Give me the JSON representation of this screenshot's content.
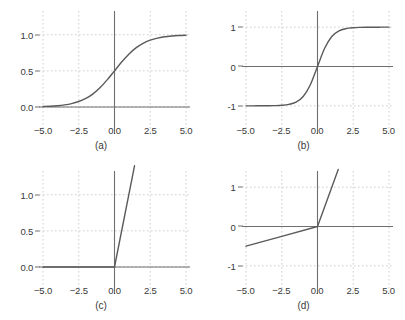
{
  "figure": {
    "columns": 2,
    "rows": 2,
    "background": "#ffffff",
    "curve_color": "#5a5a5a",
    "axis_color": "#6f6f6f",
    "grid_color": "#cfcfcf",
    "text_color": "#3a3a3a"
  },
  "chart_data": [
    {
      "type": "line",
      "panel": "a",
      "caption": "(a)",
      "title": "",
      "function": "sigmoid",
      "xlabel": "",
      "ylabel": "",
      "xlim": [
        -5.0,
        5.0
      ],
      "ylim": [
        -0.18,
        1.3
      ],
      "grid": true,
      "legend": "none",
      "xticks": [
        -5.0,
        -2.5,
        0.0,
        2.5,
        5.0
      ],
      "xticklabels": [
        "-5.0",
        "-2.5",
        "0.0",
        "2.5",
        "5.0"
      ],
      "yticks": [
        0.0,
        0.5,
        1.0
      ],
      "yticklabels": [
        "0.0",
        "0.5",
        "1.0"
      ],
      "x": [
        -5.0,
        -4.5,
        -4.0,
        -3.5,
        -3.0,
        -2.5,
        -2.0,
        -1.5,
        -1.0,
        -0.5,
        0.0,
        0.5,
        1.0,
        1.5,
        2.0,
        2.5,
        3.0,
        3.5,
        4.0,
        4.5,
        5.0
      ],
      "values": [
        0.007,
        0.011,
        0.018,
        0.029,
        0.047,
        0.076,
        0.119,
        0.182,
        0.269,
        0.378,
        0.5,
        0.622,
        0.731,
        0.818,
        0.881,
        0.924,
        0.953,
        0.971,
        0.982,
        0.989,
        0.993
      ]
    },
    {
      "type": "line",
      "panel": "b",
      "caption": "(b)",
      "title": "",
      "function": "tanh",
      "xlabel": "",
      "ylabel": "",
      "xlim": [
        -5.0,
        5.0
      ],
      "ylim": [
        -1.36,
        1.36
      ],
      "grid": true,
      "legend": "none",
      "xticks": [
        -5.0,
        -2.5,
        0.0,
        2.5,
        5.0
      ],
      "xticklabels": [
        "-5.0",
        "-2.5",
        "0.0",
        "2.5",
        "5.0"
      ],
      "yticks": [
        -1,
        0,
        1
      ],
      "yticklabels": [
        "-1",
        "0",
        "1"
      ],
      "x": [
        -5.0,
        -4.5,
        -4.0,
        -3.5,
        -3.0,
        -2.5,
        -2.0,
        -1.5,
        -1.0,
        -0.5,
        0.0,
        0.5,
        1.0,
        1.5,
        2.0,
        2.5,
        3.0,
        3.5,
        4.0,
        4.5,
        5.0
      ],
      "values": [
        -0.9999,
        -0.9998,
        -0.9993,
        -0.9982,
        -0.9951,
        -0.9866,
        -0.964,
        -0.9051,
        -0.7616,
        -0.4621,
        0.0,
        0.4621,
        0.7616,
        0.9051,
        0.964,
        0.9866,
        0.9951,
        0.9982,
        0.9993,
        0.9998,
        0.9999
      ]
    },
    {
      "type": "line",
      "panel": "c",
      "caption": "(c)",
      "title": "",
      "function": "relu",
      "xlabel": "",
      "ylabel": "",
      "xlim": [
        -5.0,
        5.0
      ],
      "ylim": [
        -0.18,
        1.3
      ],
      "grid": true,
      "legend": "none",
      "xticks": [
        -5.0,
        -2.5,
        0.0,
        2.5,
        5.0
      ],
      "xticklabels": [
        "-5.0",
        "-2.5",
        "0.0",
        "2.5",
        "5.0"
      ],
      "yticks": [
        0.0,
        0.5,
        1.0
      ],
      "yticklabels": [
        "0.0",
        "0.5",
        "1.0"
      ],
      "x": [
        -5.0,
        -2.5,
        0.0,
        1.4
      ],
      "values": [
        0.0,
        0.0,
        0.0,
        1.4
      ],
      "note": "clipped at top of axes"
    },
    {
      "type": "line",
      "panel": "d",
      "caption": "(d)",
      "title": "",
      "function": "leaky-relu",
      "xlabel": "",
      "ylabel": "",
      "xlim": [
        -5.0,
        5.0
      ],
      "ylim": [
        -1.36,
        1.36
      ],
      "grid": true,
      "legend": "none",
      "xticks": [
        -5.0,
        -2.5,
        0.0,
        2.5,
        5.0
      ],
      "xticklabels": [
        "-5.0",
        "-2.5",
        "0.0",
        "2.5",
        "5.0"
      ],
      "yticks": [
        -1,
        0,
        1
      ],
      "yticklabels": [
        "-1",
        "0",
        "1"
      ],
      "x": [
        -5.0,
        -2.5,
        0.0,
        1.45
      ],
      "values": [
        -0.5,
        -0.25,
        0.0,
        1.45
      ],
      "negative_slope": 0.1,
      "note": "clipped at top of axes"
    }
  ]
}
